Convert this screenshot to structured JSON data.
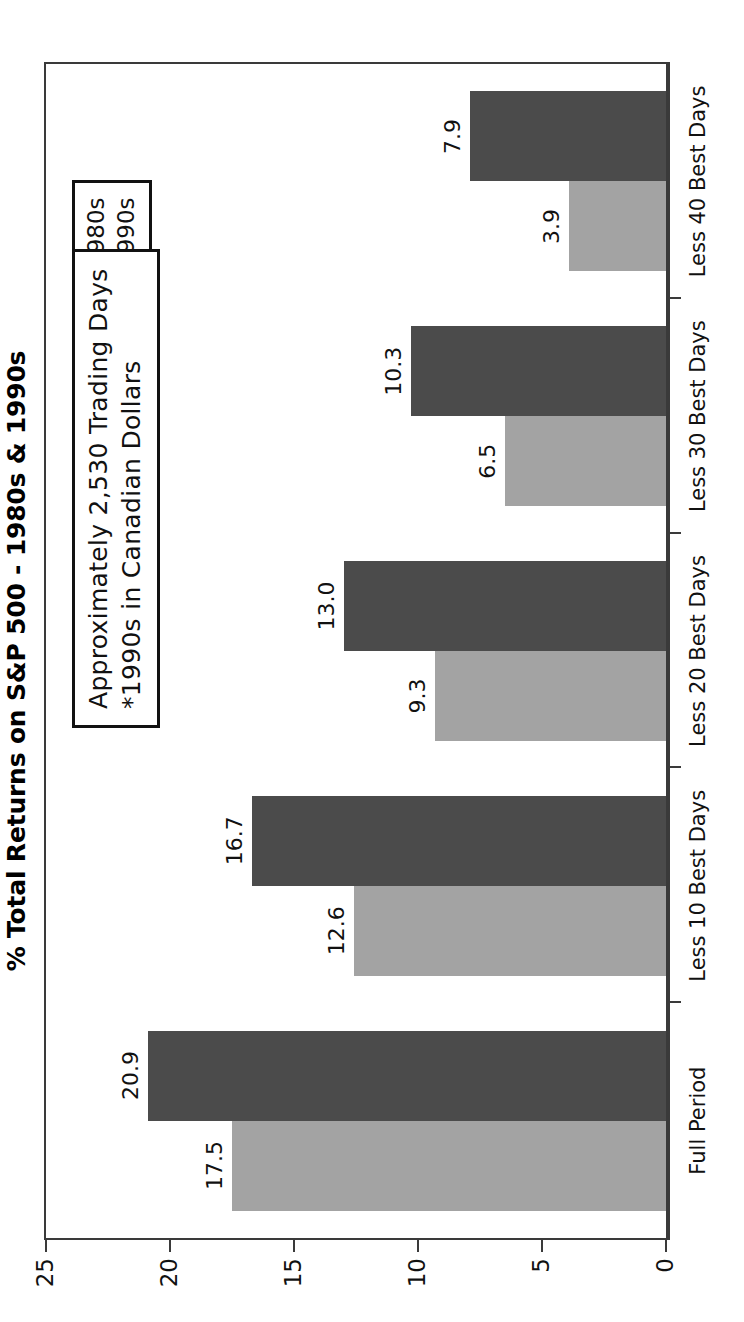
{
  "chart_data": {
    "type": "bar",
    "title": "% Total Returns on S&P 500 - 1980s & 1990s",
    "xlabel": "",
    "ylabel": "",
    "ylim": [
      0,
      25
    ],
    "yticks": [
      "0",
      "5",
      "10",
      "15",
      "20",
      "25"
    ],
    "ytick_values": [
      0,
      5,
      10,
      15,
      20,
      25
    ],
    "grid": false,
    "orientation": "vertical",
    "legend_position": "upper-right",
    "categories": [
      "Full Period",
      "Less 10 Best Days",
      "Less 20 Best Days",
      "Less 30 Best Days",
      "Less 40 Best Days"
    ],
    "series": [
      {
        "name": "1980s",
        "color": "#a3a3a3",
        "values": [
          17.5,
          12.6,
          9.3,
          6.5,
          3.9
        ],
        "labels": [
          "17.5",
          "12.6",
          "9.3",
          "6.5",
          "3.9"
        ]
      },
      {
        "name": "1990s",
        "color": "#4b4b4b",
        "values": [
          20.9,
          16.7,
          13.0,
          10.3,
          7.9
        ],
        "labels": [
          "20.9",
          "16.7",
          "13.0",
          "10.3",
          "7.9"
        ]
      }
    ],
    "annotations": [
      "Approximately 2,530 Trading Days",
      "*1990s in Canadian Dollars"
    ]
  },
  "legend": {
    "items": [
      {
        "label": "1980s",
        "color": "#a3a3a3"
      },
      {
        "label": "1990s",
        "color": "#4b4b4b"
      }
    ]
  },
  "note": {
    "line1": "Approximately 2,530 Trading Days",
    "line2": "*1990s in Canadian Dollars"
  },
  "colors": {
    "series_1980s": "#a3a3a3",
    "series_1990s": "#4b4b4b",
    "axis": "#3a3a3a",
    "text": "#111111",
    "background": "#ffffff"
  }
}
